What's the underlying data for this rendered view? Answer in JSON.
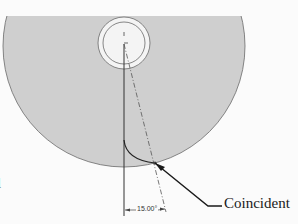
{
  "figure": {
    "callout": {
      "label": "Coincident"
    },
    "dimension": {
      "label": "15.00°"
    },
    "edge_fragment": {
      "text": "l"
    },
    "colors": {
      "background": "#fbfbfb",
      "part_fill": "#cfcfcf",
      "outline": "#6a6a6a",
      "hole_fill": "#f4f4f4",
      "sketch_line": "#333333",
      "leader": "#1a1a1a"
    }
  }
}
